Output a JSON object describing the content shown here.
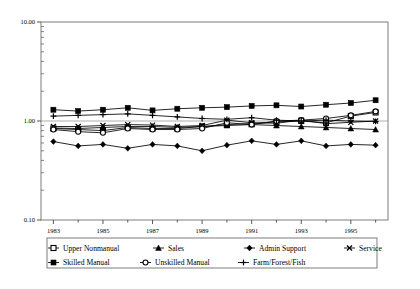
{
  "chart_data": {
    "type": "line",
    "title": "",
    "xlabel": "",
    "ylabel": "",
    "yscale": "log",
    "ylim": [
      0.1,
      10.0
    ],
    "ytick_labels": [
      "10.00",
      "1.00",
      "0.10"
    ],
    "ytick_values": [
      10.0,
      1.0,
      0.1
    ],
    "grid": false,
    "legend_position": "bottom",
    "x": [
      1983,
      1984,
      1985,
      1986,
      1987,
      1988,
      1989,
      1990,
      1991,
      1992,
      1993,
      1994,
      1995,
      1996
    ],
    "xtick_labels": [
      "1983",
      "1985",
      "1987",
      "1989",
      "1991",
      "1993",
      "1995"
    ],
    "xtick_values": [
      1983,
      1985,
      1987,
      1989,
      1991,
      1993,
      1995
    ],
    "xlim": [
      1982.5,
      1996.5
    ],
    "series": [
      {
        "name": "Upper Nonmanual",
        "marker": "open-square",
        "values": [
          0.84,
          0.82,
          0.8,
          0.86,
          0.84,
          0.84,
          0.88,
          0.92,
          0.94,
          0.98,
          1.0,
          0.96,
          1.12,
          1.22
        ]
      },
      {
        "name": "Sales",
        "marker": "filled-triangle",
        "values": [
          0.85,
          0.84,
          0.86,
          0.88,
          0.88,
          0.86,
          0.88,
          0.9,
          0.92,
          0.9,
          0.88,
          0.86,
          0.84,
          0.82
        ]
      },
      {
        "name": "Admin Support",
        "marker": "filled-diamond",
        "values": [
          0.62,
          0.56,
          0.58,
          0.53,
          0.58,
          0.56,
          0.5,
          0.57,
          0.63,
          0.58,
          0.63,
          0.56,
          0.58,
          0.57
        ]
      },
      {
        "name": "Service",
        "marker": "x-mark",
        "values": [
          0.88,
          0.88,
          0.9,
          0.92,
          0.91,
          0.88,
          0.9,
          1.02,
          0.96,
          0.95,
          1.02,
          0.94,
          0.97,
          1.0
        ]
      },
      {
        "name": "Skilled Manual",
        "marker": "filled-square",
        "values": [
          1.3,
          1.26,
          1.3,
          1.36,
          1.28,
          1.33,
          1.36,
          1.38,
          1.42,
          1.44,
          1.4,
          1.46,
          1.52,
          1.62
        ]
      },
      {
        "name": "Unskilled Manual",
        "marker": "open-circle",
        "values": [
          0.82,
          0.78,
          0.76,
          0.84,
          0.82,
          0.82,
          0.84,
          0.96,
          0.92,
          1.0,
          1.02,
          1.06,
          1.14,
          1.25
        ]
      },
      {
        "name": "Farm/Forest/Fish",
        "marker": "plus",
        "values": [
          1.12,
          1.14,
          1.16,
          1.18,
          1.14,
          1.1,
          1.06,
          1.04,
          1.08,
          1.02,
          1.0,
          1.02,
          1.0,
          0.99
        ]
      }
    ]
  },
  "legend": {
    "entries": [
      {
        "label": "Upper Nonmanual",
        "marker": "open-square"
      },
      {
        "label": "Sales",
        "marker": "filled-triangle"
      },
      {
        "label": "Admin Support",
        "marker": "filled-diamond"
      },
      {
        "label": "Service",
        "marker": "x-mark"
      },
      {
        "label": "Skilled Manual",
        "marker": "filled-square"
      },
      {
        "label": "Unskilled Manual",
        "marker": "open-circle"
      },
      {
        "label": "Farm/Forest/Fish",
        "marker": "plus"
      }
    ]
  },
  "colors": {
    "line": "#000000",
    "frame": "#666666",
    "background": "#ffffff"
  }
}
